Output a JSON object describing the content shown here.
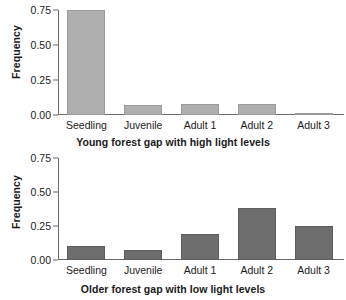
{
  "chart_data": [
    {
      "type": "bar",
      "title": "Young forest gap with high light levels",
      "xlabel": "",
      "ylabel": "Frequency",
      "categories": [
        "Seedling",
        "Juvenile",
        "Adult 1",
        "Adult 2",
        "Adult 3"
      ],
      "values": [
        0.75,
        0.07,
        0.08,
        0.08,
        0.01
      ],
      "ylim": [
        0.0,
        0.75
      ],
      "yticks": [
        "0.00",
        "0.25",
        "0.50",
        "0.75"
      ],
      "ytickvalues": [
        0.0,
        0.25,
        0.5,
        0.75
      ],
      "grid": false,
      "legend": "none",
      "bar_color": "#afafaf",
      "bar_edge_color": "#9a9a9a"
    },
    {
      "type": "bar",
      "title": "Older forest gap with low light levels",
      "xlabel": "",
      "ylabel": "Frequency",
      "categories": [
        "Seedling",
        "Juvenile",
        "Adult 1",
        "Adult 2",
        "Adult 3"
      ],
      "values": [
        0.1,
        0.07,
        0.19,
        0.38,
        0.25
      ],
      "ylim": [
        0.0,
        0.75
      ],
      "yticks": [
        "0.00",
        "0.25",
        "0.50",
        "0.75"
      ],
      "ytickvalues": [
        0.0,
        0.25,
        0.5,
        0.75
      ],
      "grid": false,
      "legend": "none",
      "bar_color": "#6e6e6e",
      "bar_edge_color": "#5d5d5d"
    }
  ],
  "axis_color": "#6a6a6a",
  "text_color": "#1a1a1a"
}
